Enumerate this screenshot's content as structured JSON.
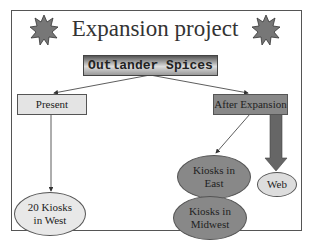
{
  "slide": {
    "title": "Expansion project",
    "company": "Outlander Spices",
    "nodes": {
      "present": "Present",
      "after_expansion": "After Expansion",
      "west_line1": "20 Kiosks",
      "west_line2": "in West",
      "east_line1": "Kiosks in",
      "east_line2": "East",
      "midwest_line1": "Kiosks in",
      "midwest_line2": "Midwest",
      "web": "Web"
    },
    "icons": [
      "starburst-icon",
      "starburst-icon"
    ],
    "colors": {
      "border": "#555555",
      "dark_fill": "#888888",
      "light_fill": "#e4e4e4"
    }
  }
}
